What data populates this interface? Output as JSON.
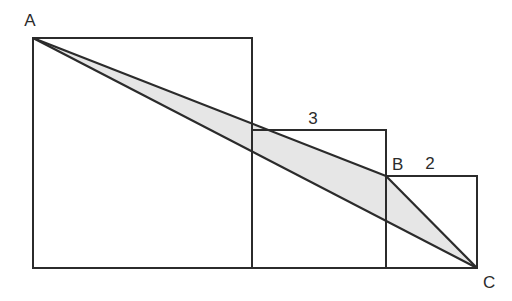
{
  "figure": {
    "background_color": "#ffffff",
    "stroke_color": "#2b2b2b",
    "shaded_fill_color": "#e6e6e6",
    "shaded_region_name": "triangle-abc",
    "canvas": {
      "width": 512,
      "height": 301
    }
  },
  "squares": [
    {
      "name": "large-square",
      "x": 33,
      "y": 38,
      "width": 219,
      "height": 230,
      "side_label": "",
      "fill": "none"
    },
    {
      "name": "medium-square",
      "x": 252,
      "y": 130,
      "width": 134,
      "height": 138,
      "side_label": "3",
      "fill": "none"
    },
    {
      "name": "small-square",
      "x": 386,
      "y": 176,
      "width": 91,
      "height": 92,
      "side_label": "2",
      "fill": "none"
    }
  ],
  "points": {
    "A": {
      "label": "A",
      "x": 33,
      "y": 38,
      "label_x": 30,
      "label_y": 26
    },
    "B": {
      "label": "B",
      "x": 386,
      "y": 176,
      "label_x": 392,
      "label_y": 170
    },
    "C": {
      "label": "C",
      "x": 477,
      "y": 268,
      "label_x": 483,
      "label_y": 288
    }
  },
  "segments": [
    {
      "name": "segment-ab",
      "from": "A",
      "to": "B"
    },
    {
      "name": "segment-bc",
      "from": "B",
      "to": "C"
    },
    {
      "name": "segment-ac",
      "from": "A",
      "to": "C"
    }
  ],
  "measure_labels": [
    {
      "name": "label-side-3",
      "text": "3",
      "x": 313,
      "y": 124
    },
    {
      "name": "label-side-2",
      "text": "2",
      "x": 430,
      "y": 169
    }
  ],
  "triangle_path": "M 33 38 L 386 176 L 477 268 Z"
}
